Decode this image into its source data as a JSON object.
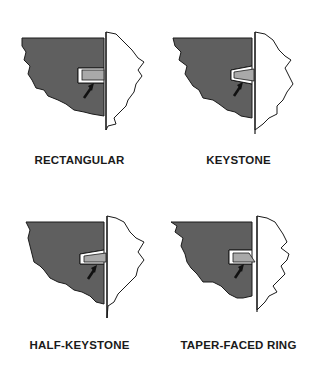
{
  "colors": {
    "piston": "#5f5f5f",
    "ring": "#a9a9a9",
    "wall": "#ffffff",
    "outline": "#1a1a1a",
    "arrow": "#111111"
  },
  "panels": [
    {
      "id": "rectangular",
      "label": "RECTANGULAR",
      "ring_shape": "rectangular"
    },
    {
      "id": "keystone",
      "label": "KEYSTONE",
      "ring_shape": "keystone"
    },
    {
      "id": "half-keystone",
      "label": "HALF-KEYSTONE",
      "ring_shape": "half-keystone"
    },
    {
      "id": "taper-faced-ring",
      "label": "TAPER-FACED RING",
      "ring_shape": "taper-faced"
    }
  ]
}
